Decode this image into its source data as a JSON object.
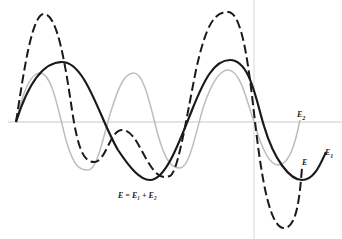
{
  "figure": {
    "equation": "E = E₁ + E₂",
    "labels": {
      "E1": {
        "text": "E",
        "sub": "1"
      },
      "E2": {
        "text": "E",
        "sub": "2"
      },
      "E": {
        "text": "E"
      }
    },
    "colors": {
      "E1": "#1a1a1a",
      "E2": "#bdbdbd",
      "E": "#1a1a1a",
      "axis": "#c8c8c8"
    },
    "curves": [
      {
        "name": "E1",
        "style": "solid thick",
        "description": "longer wavelength wave"
      },
      {
        "name": "E2",
        "style": "solid light gray",
        "description": "shorter wavelength wave"
      },
      {
        "name": "E",
        "style": "dashed",
        "description": "resultant sum E1 + E2"
      }
    ]
  }
}
